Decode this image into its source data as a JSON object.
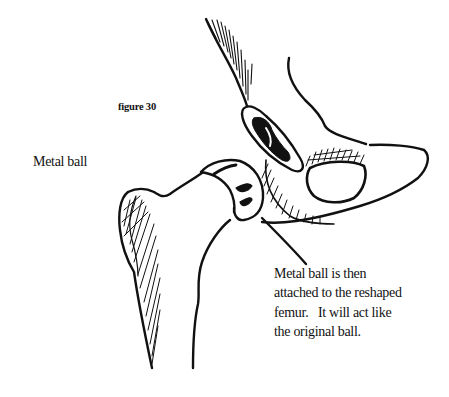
{
  "figure": {
    "label": "figure 30"
  },
  "labels": {
    "metal_ball": "Metal ball"
  },
  "caption": {
    "lines": [
      "Metal ball is then",
      "attached to the reshaped",
      "femur.   It will act like",
      "the original ball."
    ]
  },
  "colors": {
    "ink": "#111111",
    "background": "#ffffff"
  }
}
